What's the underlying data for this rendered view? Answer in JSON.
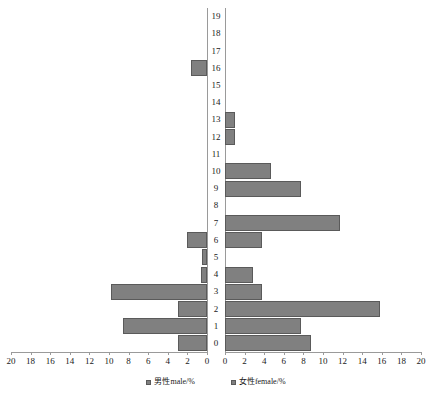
{
  "chart_data": {
    "type": "bar",
    "title": "",
    "subtitle": "",
    "orientation": "horizontal-pyramid",
    "xlabel": "",
    "ylabel": "",
    "grid": false,
    "legend_position": "bottom",
    "categories": [
      "0",
      "1",
      "2",
      "3",
      "4",
      "5",
      "6",
      "7",
      "8",
      "9",
      "10",
      "11",
      "12",
      "13",
      "14",
      "15",
      "16",
      "17",
      "18",
      "19"
    ],
    "axis": {
      "left_ticks": [
        20,
        18,
        16,
        14,
        12,
        10,
        8,
        6,
        4,
        2,
        0
      ],
      "right_ticks": [
        0,
        2,
        4,
        6,
        8,
        10,
        12,
        14,
        16,
        18,
        20
      ],
      "xlim_left": [
        0,
        20
      ],
      "xlim_right": [
        0,
        20
      ],
      "unit": "%"
    },
    "series": [
      {
        "name": "男性male/%",
        "side": "left",
        "color": "#808080",
        "values": [
          3.0,
          8.6,
          3.0,
          9.8,
          0.6,
          0.5,
          2.0,
          0.0,
          0.0,
          0.0,
          0.0,
          0.0,
          0.0,
          0.0,
          0.0,
          0.0,
          1.6,
          0.0,
          0.0,
          0.0
        ]
      },
      {
        "name": "女性female/%",
        "side": "right",
        "color": "#808080",
        "values": [
          8.8,
          7.8,
          15.8,
          3.8,
          2.9,
          0.0,
          3.8,
          11.7,
          0.0,
          7.8,
          4.7,
          0.0,
          1.0,
          1.0,
          0.0,
          0.0,
          0.0,
          0.0,
          0.0,
          0.0
        ]
      }
    ]
  },
  "legend": {
    "items": [
      {
        "label": "男性male/%"
      },
      {
        "label": "女性female/%"
      }
    ]
  },
  "colors": {
    "bar_fill": "#808080",
    "bar_stroke": "#5a5a5a",
    "axis": "#9a9a9a",
    "text": "#1a1a1a",
    "background": "#ffffff"
  }
}
